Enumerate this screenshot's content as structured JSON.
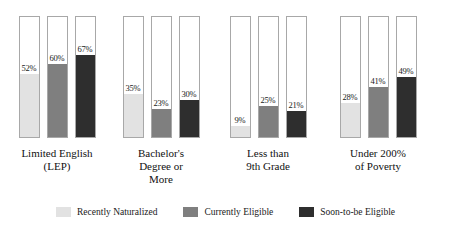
{
  "chart_data": {
    "type": "bar",
    "title": "",
    "subtitle": "",
    "xlabel": "",
    "ylabel": "",
    "ylim": [
      0,
      100
    ],
    "grid": false,
    "legend_position": "bottom",
    "value_suffix": "%",
    "categories": [
      "Limited English\n(LEP)",
      "Bachelor's\nDegree or\nMore",
      "Less than\n9th Grade",
      "Under 200%\nof Poverty"
    ],
    "series": [
      {
        "name": "Recently Naturalized",
        "color": "#e2e2e2",
        "values": [
          52,
          35,
          9,
          28
        ],
        "labels": [
          "52%",
          "35%",
          "9%",
          "28%"
        ]
      },
      {
        "name": "Currently Eligible",
        "color": "#7f7f7f",
        "values": [
          60,
          23,
          25,
          41
        ],
        "labels": [
          "60%",
          "23%",
          "25%",
          "41%"
        ]
      },
      {
        "name": "Soon-to-be Eligible",
        "color": "#2e2e2e",
        "values": [
          67,
          30,
          21,
          49
        ],
        "labels": [
          "67%",
          "30%",
          "21%",
          "49%"
        ]
      }
    ]
  }
}
